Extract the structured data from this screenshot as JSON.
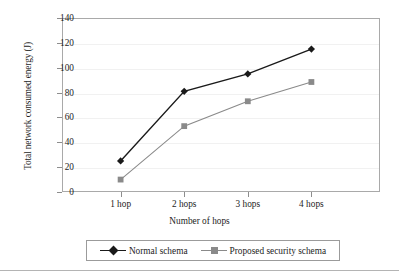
{
  "chart_data": {
    "type": "line",
    "title": "",
    "xlabel": "Number of hops",
    "ylabel": "Total network consumed energy (J)",
    "categories": [
      "1 hop",
      "2 hops",
      "3 hops",
      "4 hops"
    ],
    "ylim": [
      0,
      140
    ],
    "yticks": [
      0,
      20,
      40,
      60,
      80,
      100,
      120,
      140
    ],
    "ytick_labels": [
      "0",
      "20",
      "40",
      "60",
      "80",
      "100",
      "120",
      "140"
    ],
    "grid": true,
    "grid_axis": "y",
    "legend_position": "below-plot",
    "series": [
      {
        "name": "Normal schema",
        "values": [
          25,
          81,
          95,
          115
        ],
        "color": "#1a1a1a",
        "marker": "diamond"
      },
      {
        "name": "Proposed security schema",
        "values": [
          10,
          53,
          73,
          88.5
        ],
        "color": "#8a8a8a",
        "marker": "square"
      }
    ]
  },
  "legend": {
    "entries": [
      {
        "label": "Normal schema"
      },
      {
        "label": "Proposed security schema"
      }
    ]
  },
  "colors": {
    "series_1": "#1a1a1a",
    "series_2": "#8a8a8a",
    "axis": "#a9a9a9",
    "grid": "#f1f1f1",
    "text": "#1d1d1d"
  }
}
